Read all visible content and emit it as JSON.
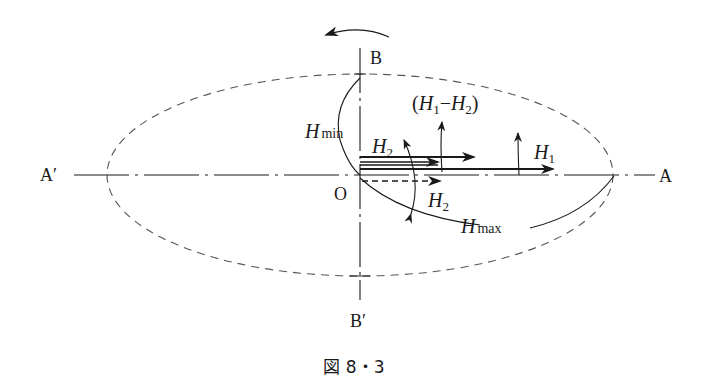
{
  "figure": {
    "caption": "図 8・3",
    "labels": {
      "A": "A",
      "A_prime": "A′",
      "B": "B",
      "B_prime": "B′",
      "O": "O",
      "H": "H",
      "H_min_sub": "min",
      "H_max_sub": "max",
      "H1_sub": "1",
      "H2_sub": "2",
      "diff_open": "(",
      "diff_minus": "−",
      "diff_close": ")"
    },
    "colors": {
      "ink": "#1a1a1a",
      "dashed": "#555555",
      "background": "#ffffff"
    }
  }
}
